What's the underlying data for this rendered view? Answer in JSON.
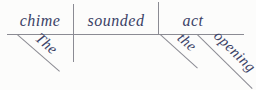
{
  "colors": {
    "background": "#fcfcfb",
    "line": "#8b8b93",
    "text": "#3a4166"
  },
  "diagram": {
    "type": "reed-kellogg-sentence-diagram",
    "subject": "chime",
    "verb": "sounded",
    "object": "act",
    "subject_modifier": "The",
    "object_modifiers": [
      "the",
      "opening"
    ]
  }
}
